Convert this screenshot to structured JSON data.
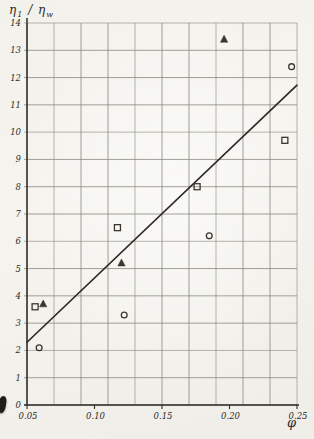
{
  "figure": {
    "kind": "scanned scatter plot with fitted straight line",
    "colors": {
      "ink": "#2f2c27",
      "grid": "#87847c",
      "paper": "#f4f2ec",
      "marker": "#3a362f"
    }
  },
  "chart_data": {
    "type": "scatter",
    "title": "",
    "ylabel_parts": {
      "eta1": "η",
      "sub1": "1",
      "slash": "/",
      "eta2": "η",
      "sub2": "w"
    },
    "xlabel": "φ",
    "xlim": [
      0.05,
      0.25
    ],
    "ylim": [
      0,
      14
    ],
    "x_grid_step": 0.02,
    "y_grid_step": 1,
    "grid": "on",
    "legend": "none",
    "x_ticks": [
      {
        "value": 0.05,
        "label": "0.05"
      },
      {
        "value": 0.1,
        "label": "0.10"
      },
      {
        "value": 0.15,
        "label": "0.15"
      },
      {
        "value": 0.2,
        "label": "0.20"
      },
      {
        "value": 0.25,
        "label": "0.25"
      }
    ],
    "y_ticks": [
      {
        "value": 0,
        "label": "0"
      },
      {
        "value": 1,
        "label": "1"
      },
      {
        "value": 2,
        "label": "2"
      },
      {
        "value": 3,
        "label": "3"
      },
      {
        "value": 4,
        "label": "4"
      },
      {
        "value": 5,
        "label": "5"
      },
      {
        "value": 6,
        "label": "6"
      },
      {
        "value": 7,
        "label": "7"
      },
      {
        "value": 8,
        "label": "8"
      },
      {
        "value": 9,
        "label": "9"
      },
      {
        "value": 10,
        "label": "10"
      },
      {
        "value": 11,
        "label": "11"
      },
      {
        "value": 12,
        "label": "12"
      },
      {
        "value": 13,
        "label": "13"
      },
      {
        "value": 14,
        "label": "14"
      }
    ],
    "series": [
      {
        "name": "open-squares",
        "marker": "square",
        "points": [
          [
            0.056,
            3.6
          ],
          [
            0.117,
            6.5
          ],
          [
            0.176,
            8.0
          ],
          [
            0.241,
            9.7
          ]
        ]
      },
      {
        "name": "filled-triangles",
        "marker": "triangle",
        "points": [
          [
            0.062,
            3.7
          ],
          [
            0.12,
            5.2
          ],
          [
            0.196,
            13.4
          ]
        ]
      },
      {
        "name": "open-circles",
        "marker": "circle",
        "points": [
          [
            0.059,
            2.1
          ],
          [
            0.122,
            3.3
          ],
          [
            0.185,
            6.2
          ],
          [
            0.246,
            12.4
          ]
        ]
      }
    ],
    "trend_line": {
      "from": [
        0.05,
        2.3
      ],
      "to": [
        0.25,
        11.72
      ]
    }
  }
}
